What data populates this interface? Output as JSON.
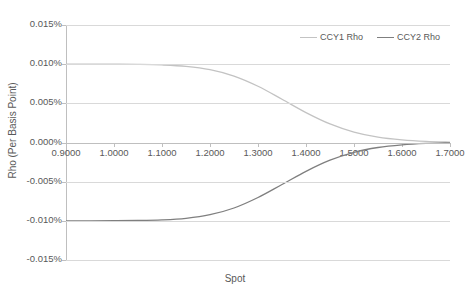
{
  "chart_data": {
    "type": "line",
    "title": "",
    "xlabel": "Spot",
    "ylabel": "Rho (Per Basis Point)",
    "xlim": [
      0.9,
      1.7
    ],
    "ylim": [
      -0.015,
      0.015
    ],
    "grid": true,
    "legend_position": "top-right",
    "x_tick_labels": [
      "0.9000",
      "1.0000",
      "1.1000",
      "1.2000",
      "1.3000",
      "1.4000",
      "1.5000",
      "1.6000",
      "1.7000"
    ],
    "x_ticks": [
      0.9,
      1.0,
      1.1,
      1.2,
      1.3,
      1.4,
      1.5,
      1.6,
      1.7
    ],
    "y_tick_labels": [
      "0.015%",
      "0.010%",
      "0.005%",
      "0.000%",
      "-0.005%",
      "-0.010%",
      "-0.015%"
    ],
    "y_ticks": [
      0.015,
      0.01,
      0.005,
      0.0,
      -0.005,
      -0.01,
      -0.015
    ],
    "x": [
      0.9,
      0.95,
      1.0,
      1.05,
      1.1,
      1.15,
      1.2,
      1.25,
      1.3,
      1.35,
      1.4,
      1.45,
      1.5,
      1.55,
      1.6,
      1.65,
      1.7
    ],
    "series": [
      {
        "name": "CCY1 Rho",
        "color": "#c3c3c3",
        "values": [
          0.01,
          0.01,
          0.00999,
          0.00997,
          0.0099,
          0.00972,
          0.0093,
          0.00848,
          0.00718,
          0.00552,
          0.00382,
          0.00237,
          0.00133,
          0.00068,
          0.00033,
          0.00014,
          5e-05
        ]
      },
      {
        "name": "CCY2 Rho",
        "color": "#7f7f7f",
        "values": [
          -0.01,
          -0.01,
          -0.00999,
          -0.00996,
          -0.00988,
          -0.00968,
          -0.00922,
          -0.00836,
          -0.00702,
          -0.00536,
          -0.00368,
          -0.00226,
          -0.00126,
          -0.00064,
          -0.0003,
          -0.00012,
          -4e-05
        ]
      }
    ]
  },
  "legend": {
    "items": [
      {
        "label": "CCY1 Rho"
      },
      {
        "label": "CCY2 Rho"
      }
    ]
  },
  "axes": {
    "x_title": "Spot",
    "y_title": "Rho (Per Basis Point)"
  },
  "colors": {
    "ccy1": "#c3c3c3",
    "ccy2": "#7f7f7f",
    "gridline": "#d9d9d9",
    "axis": "#bfbfbf",
    "tick_text": "#595959",
    "background": "#ffffff"
  }
}
